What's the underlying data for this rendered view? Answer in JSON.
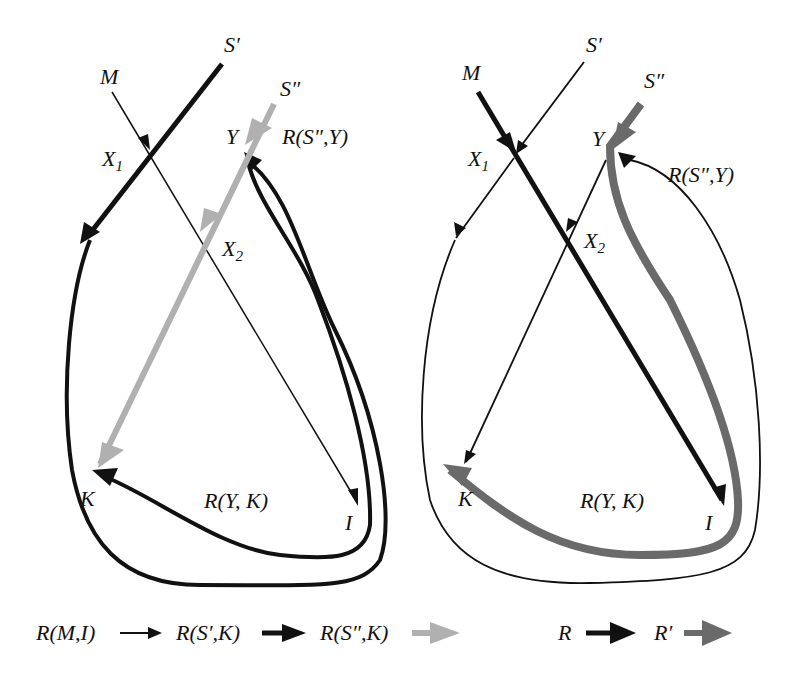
{
  "left_panel": {
    "labels": {
      "S_prime": "S′",
      "S_dprime": "S″",
      "M": "M",
      "X1": "X",
      "X1_sub": "1",
      "X2": "X",
      "X2_sub": "2",
      "Y": "Y",
      "K": "K",
      "I": "I",
      "R_S2_Y": "R(S″,Y)",
      "R_Y_K": "R(Y, K)"
    }
  },
  "right_panel": {
    "labels": {
      "S_prime": "S′",
      "S_dprime": "S″",
      "M": "M",
      "X1": "X",
      "X1_sub": "1",
      "X2": "X",
      "X2_sub": "2",
      "Y": "Y",
      "K": "K",
      "I": "I",
      "R_S2_Y": "R(S″,Y)",
      "R_Y_K": "R(Y, K)"
    }
  },
  "legend_left": [
    {
      "label": "R(M,I)",
      "style": "thin-black"
    },
    {
      "label": "R(S′,K)",
      "style": "thick-black"
    },
    {
      "label": "R(S″,K)",
      "style": "thick-lightgray"
    }
  ],
  "legend_right": [
    {
      "label": "R",
      "style": "thick-black"
    },
    {
      "label": "R′",
      "style": "thick-darkgray"
    }
  ],
  "colors": {
    "black": "#111111",
    "light_gray": "#b0b0b0",
    "dark_gray": "#6a6a6a"
  }
}
